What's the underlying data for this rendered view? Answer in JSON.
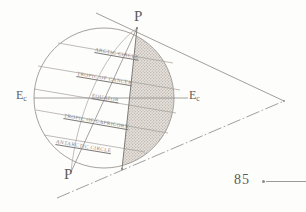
{
  "figure": {
    "poles": [
      {
        "label": "P",
        "position": "top",
        "x": 137,
        "y": 25
      },
      {
        "label": "P",
        "position": "bottom",
        "x": 67,
        "y": 178
      }
    ],
    "ecliptic_markers": [
      {
        "label": "E",
        "subscript": "c",
        "side": "left",
        "x": 17,
        "y": 94
      },
      {
        "label": "E",
        "subscript": "c",
        "side": "right",
        "x": 190,
        "y": 94
      }
    ],
    "latitude_circles": [
      {
        "name": "ARCTIC CIRCLE",
        "latitude": 66.5,
        "hemisphere": "north"
      },
      {
        "name": "TROPIC OF CANCER",
        "latitude": 23.5,
        "hemisphere": "north"
      },
      {
        "name": "EQUATOR",
        "latitude": 0,
        "hemisphere": "none"
      },
      {
        "name": "TROPIC OF CAPRICORN",
        "latitude": -23.5,
        "hemisphere": "south"
      },
      {
        "name": "ANTARCTIC CIRCLE",
        "latitude": -66.5,
        "hemisphere": "south"
      }
    ],
    "shaded_region": "night-side / illuminated hemisphere hatch",
    "colors": {
      "ink": "#7d7a78",
      "label_ink": "#6b6b6b",
      "shade": "#cfcac5",
      "paper": "#fdfdfc"
    }
  },
  "page": {
    "number": "85"
  }
}
